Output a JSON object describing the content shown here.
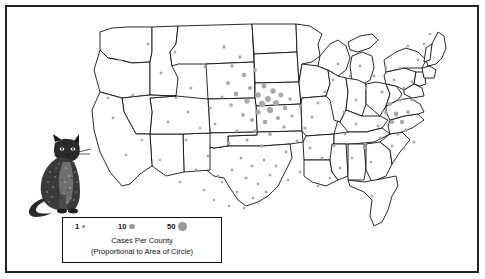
{
  "figure": {
    "title": "Cases Per County",
    "subtitle": "(Proportional to Area of Circle)"
  },
  "legend": {
    "name": "map-legend",
    "caption_line1": "Cases Per County",
    "caption_line2": "(Proportional to Area of Circle)",
    "keys": [
      {
        "label": "1",
        "value": 1,
        "radius_px": 1.2
      },
      {
        "label": "10",
        "value": 10,
        "radius_px": 2.6
      },
      {
        "label": "50",
        "value": 50,
        "radius_px": 4.2
      }
    ]
  },
  "illustration": {
    "name": "cat-illustration",
    "subject": "sitting domestic cat, stippled line drawing"
  },
  "colors": {
    "dot": "#a8a8a8",
    "state_outline": "#111111",
    "frame": "#222222",
    "background": "#ffffff"
  },
  "chart_data": {
    "type": "scatter",
    "title": "Cases Per County",
    "subtitle": "(Proportional to Area of Circle)",
    "xlabel": "",
    "ylabel": "",
    "projection": "contiguous United States, county dot-density",
    "grid": false,
    "legend_position": "bottom-center",
    "symbol": "proportional circle (area proportional to case count)",
    "legend_values": [
      1,
      10,
      50
    ],
    "regions": [
      {
        "name": "Upper Midwest (Iowa, Minnesota, Nebraska, Illinois)",
        "density": "very high"
      },
      {
        "name": "Great Plains (Kansas, Missouri, South Dakota)",
        "density": "high"
      },
      {
        "name": "Texas",
        "density": "moderate"
      },
      {
        "name": "Mid-Atlantic (Maryland, Virginia, Pennsylvania, New Jersey)",
        "density": "moderate"
      },
      {
        "name": "Southeast (Georgia, Alabama, Tennessee, Carolinas)",
        "density": "low"
      },
      {
        "name": "Mountain West and Pacific Coast",
        "density": "very low"
      },
      {
        "name": "Northern New England",
        "density": "very low"
      }
    ],
    "points": [
      {
        "x": 120,
        "y": 60,
        "r": 1.6
      },
      {
        "x": 148,
        "y": 44,
        "r": 1.4
      },
      {
        "x": 133,
        "y": 95,
        "r": 1.5
      },
      {
        "x": 113,
        "y": 118,
        "r": 1.4
      },
      {
        "x": 108,
        "y": 98,
        "r": 1.3
      },
      {
        "x": 161,
        "y": 73,
        "r": 1.5
      },
      {
        "x": 175,
        "y": 52,
        "r": 1.4
      },
      {
        "x": 191,
        "y": 88,
        "r": 1.5
      },
      {
        "x": 205,
        "y": 67,
        "r": 1.6
      },
      {
        "x": 168,
        "y": 122,
        "r": 1.4
      },
      {
        "x": 186,
        "y": 140,
        "r": 1.4
      },
      {
        "x": 210,
        "y": 108,
        "r": 1.6
      },
      {
        "x": 224,
        "y": 47,
        "r": 1.7
      },
      {
        "x": 232,
        "y": 66,
        "r": 1.8
      },
      {
        "x": 228,
        "y": 83,
        "r": 2.0
      },
      {
        "x": 240,
        "y": 57,
        "r": 1.7
      },
      {
        "x": 244,
        "y": 75,
        "r": 2.2
      },
      {
        "x": 236,
        "y": 94,
        "r": 2.4
      },
      {
        "x": 250,
        "y": 88,
        "r": 2.1
      },
      {
        "x": 255,
        "y": 70,
        "r": 1.9
      },
      {
        "x": 247,
        "y": 101,
        "r": 2.6
      },
      {
        "x": 258,
        "y": 95,
        "r": 2.8
      },
      {
        "x": 264,
        "y": 86,
        "r": 2.5
      },
      {
        "x": 268,
        "y": 99,
        "r": 3.0
      },
      {
        "x": 273,
        "y": 91,
        "r": 2.7
      },
      {
        "x": 262,
        "y": 104,
        "r": 3.2
      },
      {
        "x": 276,
        "y": 103,
        "r": 2.9
      },
      {
        "x": 281,
        "y": 95,
        "r": 2.4
      },
      {
        "x": 270,
        "y": 110,
        "r": 3.1
      },
      {
        "x": 258,
        "y": 112,
        "r": 2.6
      },
      {
        "x": 285,
        "y": 108,
        "r": 2.2
      },
      {
        "x": 252,
        "y": 120,
        "r": 2.0
      },
      {
        "x": 265,
        "y": 122,
        "r": 2.3
      },
      {
        "x": 278,
        "y": 118,
        "r": 2.1
      },
      {
        "x": 243,
        "y": 115,
        "r": 1.9
      },
      {
        "x": 290,
        "y": 99,
        "r": 1.8
      },
      {
        "x": 255,
        "y": 131,
        "r": 1.8
      },
      {
        "x": 270,
        "y": 134,
        "r": 1.9
      },
      {
        "x": 284,
        "y": 127,
        "r": 1.7
      },
      {
        "x": 247,
        "y": 140,
        "r": 1.6
      },
      {
        "x": 262,
        "y": 146,
        "r": 1.7
      },
      {
        "x": 237,
        "y": 131,
        "r": 1.6
      },
      {
        "x": 292,
        "y": 116,
        "r": 1.6
      },
      {
        "x": 300,
        "y": 106,
        "r": 1.5
      },
      {
        "x": 231,
        "y": 105,
        "r": 1.8
      },
      {
        "x": 222,
        "y": 97,
        "r": 1.6
      },
      {
        "x": 215,
        "y": 124,
        "r": 1.5
      },
      {
        "x": 229,
        "y": 143,
        "r": 1.5
      },
      {
        "x": 241,
        "y": 158,
        "r": 1.5
      },
      {
        "x": 252,
        "y": 166,
        "r": 1.6
      },
      {
        "x": 264,
        "y": 160,
        "r": 1.5
      },
      {
        "x": 246,
        "y": 178,
        "r": 1.5
      },
      {
        "x": 258,
        "y": 184,
        "r": 1.4
      },
      {
        "x": 232,
        "y": 170,
        "r": 1.4
      },
      {
        "x": 270,
        "y": 175,
        "r": 1.5
      },
      {
        "x": 237,
        "y": 192,
        "r": 1.4
      },
      {
        "x": 253,
        "y": 198,
        "r": 1.4
      },
      {
        "x": 222,
        "y": 182,
        "r": 1.3
      },
      {
        "x": 266,
        "y": 192,
        "r": 1.4
      },
      {
        "x": 276,
        "y": 166,
        "r": 1.4
      },
      {
        "x": 286,
        "y": 152,
        "r": 1.5
      },
      {
        "x": 297,
        "y": 141,
        "r": 1.5
      },
      {
        "x": 305,
        "y": 128,
        "r": 1.6
      },
      {
        "x": 312,
        "y": 117,
        "r": 1.5
      },
      {
        "x": 318,
        "y": 103,
        "r": 1.5
      },
      {
        "x": 325,
        "y": 92,
        "r": 1.4
      },
      {
        "x": 333,
        "y": 80,
        "r": 1.4
      },
      {
        "x": 310,
        "y": 148,
        "r": 1.5
      },
      {
        "x": 322,
        "y": 158,
        "r": 1.4
      },
      {
        "x": 334,
        "y": 146,
        "r": 1.4
      },
      {
        "x": 345,
        "y": 134,
        "r": 1.4
      },
      {
        "x": 356,
        "y": 124,
        "r": 1.4
      },
      {
        "x": 340,
        "y": 168,
        "r": 1.4
      },
      {
        "x": 352,
        "y": 158,
        "r": 1.3
      },
      {
        "x": 364,
        "y": 148,
        "r": 1.4
      },
      {
        "x": 330,
        "y": 178,
        "r": 1.3
      },
      {
        "x": 318,
        "y": 186,
        "r": 1.3
      },
      {
        "x": 300,
        "y": 172,
        "r": 1.4
      },
      {
        "x": 288,
        "y": 180,
        "r": 1.3
      },
      {
        "x": 371,
        "y": 162,
        "r": 1.3
      },
      {
        "x": 362,
        "y": 180,
        "r": 1.3
      },
      {
        "x": 372,
        "y": 196,
        "r": 1.3
      },
      {
        "x": 344,
        "y": 112,
        "r": 1.5
      },
      {
        "x": 356,
        "y": 100,
        "r": 1.4
      },
      {
        "x": 366,
        "y": 88,
        "r": 1.4
      },
      {
        "x": 350,
        "y": 76,
        "r": 1.4
      },
      {
        "x": 338,
        "y": 64,
        "r": 1.4
      },
      {
        "x": 360,
        "y": 66,
        "r": 1.4
      },
      {
        "x": 374,
        "y": 76,
        "r": 1.5
      },
      {
        "x": 382,
        "y": 92,
        "r": 1.6
      },
      {
        "x": 390,
        "y": 104,
        "r": 2.0
      },
      {
        "x": 396,
        "y": 114,
        "r": 2.4
      },
      {
        "x": 402,
        "y": 122,
        "r": 2.2
      },
      {
        "x": 408,
        "y": 112,
        "r": 1.9
      },
      {
        "x": 400,
        "y": 100,
        "r": 1.8
      },
      {
        "x": 392,
        "y": 122,
        "r": 2.1
      },
      {
        "x": 386,
        "y": 113,
        "r": 1.8
      },
      {
        "x": 406,
        "y": 130,
        "r": 1.7
      },
      {
        "x": 398,
        "y": 134,
        "r": 1.6
      },
      {
        "x": 412,
        "y": 100,
        "r": 1.6
      },
      {
        "x": 404,
        "y": 88,
        "r": 1.5
      },
      {
        "x": 394,
        "y": 80,
        "r": 1.4
      },
      {
        "x": 386,
        "y": 68,
        "r": 1.4
      },
      {
        "x": 400,
        "y": 68,
        "r": 1.4
      },
      {
        "x": 412,
        "y": 82,
        "r": 1.4
      },
      {
        "x": 418,
        "y": 60,
        "r": 1.4
      },
      {
        "x": 408,
        "y": 46,
        "r": 1.3
      },
      {
        "x": 424,
        "y": 44,
        "r": 1.3
      },
      {
        "x": 430,
        "y": 34,
        "r": 1.3
      },
      {
        "x": 414,
        "y": 142,
        "r": 1.5
      },
      {
        "x": 404,
        "y": 148,
        "r": 1.4
      },
      {
        "x": 392,
        "y": 146,
        "r": 1.4
      },
      {
        "x": 380,
        "y": 138,
        "r": 1.4
      },
      {
        "x": 378,
        "y": 126,
        "r": 1.5
      },
      {
        "x": 160,
        "y": 160,
        "r": 1.3
      },
      {
        "x": 142,
        "y": 140,
        "r": 1.3
      },
      {
        "x": 126,
        "y": 155,
        "r": 1.3
      },
      {
        "x": 196,
        "y": 170,
        "r": 1.4
      },
      {
        "x": 208,
        "y": 156,
        "r": 1.4
      },
      {
        "x": 180,
        "y": 182,
        "r": 1.3
      },
      {
        "x": 218,
        "y": 176,
        "r": 1.4
      },
      {
        "x": 204,
        "y": 190,
        "r": 1.3
      },
      {
        "x": 214,
        "y": 200,
        "r": 1.3
      },
      {
        "x": 229,
        "y": 206,
        "r": 1.3
      },
      {
        "x": 244,
        "y": 208,
        "r": 1.3
      },
      {
        "x": 188,
        "y": 112,
        "r": 1.4
      },
      {
        "x": 176,
        "y": 98,
        "r": 1.3
      },
      {
        "x": 200,
        "y": 128,
        "r": 1.3
      }
    ]
  }
}
